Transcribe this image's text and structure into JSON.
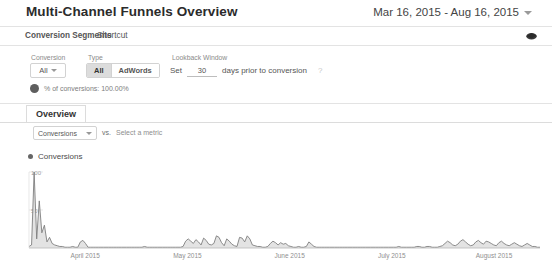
{
  "header": {
    "title": "Multi-Channel Funnels Overview",
    "date_range": "Mar 16, 2015 - Aug 16, 2015",
    "caret_icon": "chevron-down-icon"
  },
  "segment_bar": {
    "segments_label": "Conversion Segments",
    "shortcut_label": "Shortcut",
    "export_icon": "export-icon"
  },
  "controls": {
    "conversion_label": "Conversion",
    "conversion_value": "All",
    "type_label": "Type",
    "type_options": [
      {
        "label": "All",
        "selected": true
      },
      {
        "label": "AdWords",
        "selected": false
      }
    ],
    "lookback_label": "Lookback Window",
    "lookback_prefix": "Set",
    "lookback_value": "30",
    "lookback_suffix": "days prior to conversion",
    "lookback_help_icon": "help-icon",
    "conversions_pct_label": "% of conversions: 100.00%"
  },
  "tabs": [
    {
      "label": "Overview",
      "selected": true
    }
  ],
  "metric_row": {
    "metric_value": "Conversions",
    "vs_label": "vs.",
    "secondary_placeholder": "Select a metric"
  },
  "chart_data": {
    "type": "line",
    "title": "",
    "legend": [
      "Conversions"
    ],
    "legend_position": "top-left",
    "xlabel": "",
    "ylabel": "",
    "ylim": [
      0,
      100
    ],
    "yticks": [
      50,
      100
    ],
    "ytick_labels": [
      "50",
      "100"
    ],
    "grid": false,
    "xtick_labels": [
      "April 2015",
      "May 2015",
      "June 2015",
      "July 2015",
      "August 2015"
    ],
    "series": [
      {
        "name": "Conversions",
        "color": "#7f7f7f",
        "fill": "#dedede",
        "values": [
          2,
          4,
          100,
          12,
          62,
          20,
          30,
          8,
          14,
          6,
          4,
          3,
          2,
          2,
          1,
          1,
          1,
          2,
          1,
          1,
          8,
          10,
          6,
          1,
          1,
          1,
          1,
          1,
          1,
          1,
          1,
          1,
          1,
          1,
          1,
          1,
          1,
          1,
          1,
          1,
          1,
          1,
          1,
          1,
          1,
          2,
          1,
          1,
          1,
          1,
          1,
          1,
          1,
          1,
          1,
          1,
          1,
          1,
          1,
          1,
          2,
          9,
          12,
          9,
          6,
          11,
          8,
          4,
          13,
          10,
          5,
          4,
          6,
          16,
          14,
          7,
          3,
          12,
          9,
          5,
          3,
          2,
          14,
          13,
          8,
          16,
          12,
          4,
          3,
          2,
          2,
          1,
          1,
          2,
          6,
          9,
          7,
          4,
          7,
          5,
          6,
          3,
          2,
          1,
          1,
          2,
          1,
          1,
          2,
          8,
          5,
          2,
          1,
          1,
          1,
          1,
          1,
          1,
          1,
          1,
          1,
          1,
          1,
          1,
          1,
          1,
          1,
          1,
          1,
          1,
          1,
          1,
          1,
          1,
          1,
          1,
          1,
          1,
          1,
          1,
          1,
          1,
          1,
          1,
          2,
          1,
          1,
          1,
          1,
          1,
          1,
          2,
          2,
          1,
          1,
          2,
          2,
          1,
          1,
          1,
          2,
          3,
          6,
          9,
          7,
          4,
          3,
          5,
          9,
          11,
          8,
          5,
          3,
          4,
          8,
          10,
          7,
          5,
          9,
          8,
          6,
          4,
          3,
          7,
          9,
          6,
          4,
          3,
          5,
          7,
          5,
          3,
          2,
          4,
          6,
          4,
          2,
          2,
          1,
          1
        ]
      }
    ]
  }
}
